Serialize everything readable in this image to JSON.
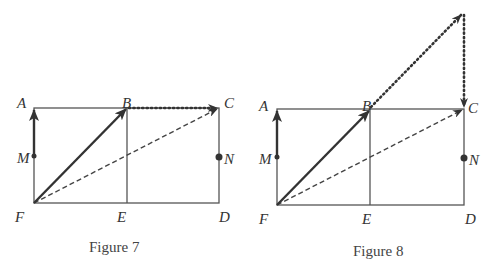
{
  "figures": [
    {
      "caption": "Figure 7",
      "points": {
        "A": "A",
        "B": "B",
        "C": "C",
        "D": "D",
        "E": "E",
        "F": "F",
        "M": "M",
        "N": "N"
      },
      "vectors": [
        {
          "from": "M",
          "to": "A",
          "style": "solid"
        },
        {
          "from": "F",
          "to": "B",
          "style": "solid"
        },
        {
          "from": "B",
          "to": "C",
          "style": "dotted"
        },
        {
          "from": "F",
          "to": "C",
          "style": "dashed"
        }
      ]
    },
    {
      "caption": "Figure 8",
      "points": {
        "A": "A",
        "B": "B",
        "C": "C",
        "D": "D",
        "E": "E",
        "F": "F",
        "M": "M",
        "N": "N"
      },
      "vectors": [
        {
          "from": "M",
          "to": "A",
          "style": "solid"
        },
        {
          "from": "F",
          "to": "B",
          "style": "solid"
        },
        {
          "from": "B",
          "to": "apex",
          "style": "dotted"
        },
        {
          "from": "apex",
          "to": "C",
          "style": "dotted"
        },
        {
          "from": "F",
          "to": "C",
          "style": "dashed"
        }
      ]
    }
  ]
}
